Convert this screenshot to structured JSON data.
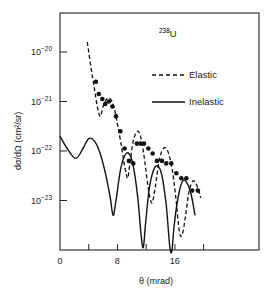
{
  "chart_data": {
    "type": "line",
    "title": "",
    "annotation": {
      "isotope_mass": "238",
      "isotope_symbol": "U"
    },
    "xlabel": "θ (mrad)",
    "ylabel": "dσ/dΩ  (cm²/sr)",
    "xlim": [
      0,
      28
    ],
    "ylim_log10": [
      -24.0,
      -19.2
    ],
    "yscale": "log",
    "grid": false,
    "legend_position": "upper right",
    "x_ticks": [
      0,
      4,
      8,
      12,
      16,
      20
    ],
    "x_tick_labels": [
      {
        "x": 0,
        "label": "0"
      },
      {
        "x": 8,
        "label": "8"
      },
      {
        "x": 16,
        "label": "16"
      }
    ],
    "y_ticks": [
      {
        "exp": -20,
        "label_base": "10",
        "label_exp": "−20"
      },
      {
        "exp": -21,
        "label_base": "10",
        "label_exp": "−21"
      },
      {
        "exp": -22,
        "label_base": "10",
        "label_exp": "−22"
      },
      {
        "exp": -23,
        "label_base": "10",
        "label_exp": "−23"
      }
    ],
    "series": [
      {
        "name": "Elastic",
        "style": "dashed",
        "points": [
          [
            3.8,
            -19.8
          ],
          [
            4.3,
            -20.3
          ],
          [
            4.8,
            -20.75
          ],
          [
            5.2,
            -21.1
          ],
          [
            5.6,
            -21.3
          ],
          [
            6.0,
            -21.1
          ],
          [
            6.5,
            -20.95
          ],
          [
            7.0,
            -20.95
          ],
          [
            7.5,
            -21.1
          ],
          [
            8.0,
            -21.45
          ],
          [
            8.5,
            -21.85
          ],
          [
            9.0,
            -22.3
          ],
          [
            9.4,
            -22.55
          ],
          [
            9.7,
            -22.3
          ],
          [
            10.2,
            -21.8
          ],
          [
            10.8,
            -21.6
          ],
          [
            11.3,
            -21.75
          ],
          [
            11.8,
            -22.2
          ],
          [
            12.3,
            -22.75
          ],
          [
            12.8,
            -23.05
          ],
          [
            13.3,
            -22.7
          ],
          [
            13.8,
            -22.2
          ],
          [
            14.4,
            -21.95
          ],
          [
            15.0,
            -22.0
          ],
          [
            15.6,
            -22.35
          ],
          [
            16.1,
            -22.9
          ],
          [
            16.6,
            -23.6
          ],
          [
            17.0,
            -23.7
          ],
          [
            17.5,
            -23.3
          ],
          [
            18.0,
            -22.8
          ],
          [
            18.6,
            -22.6
          ],
          [
            19.2,
            -22.75
          ],
          [
            19.6,
            -22.95
          ]
        ]
      },
      {
        "name": "Inelastic",
        "style": "solid",
        "points": [
          [
            0.0,
            -21.7
          ],
          [
            1.0,
            -21.95
          ],
          [
            2.2,
            -22.15
          ],
          [
            3.2,
            -21.95
          ],
          [
            4.0,
            -21.75
          ],
          [
            4.8,
            -21.8
          ],
          [
            5.6,
            -22.05
          ],
          [
            6.4,
            -22.5
          ],
          [
            7.0,
            -22.95
          ],
          [
            7.4,
            -23.3
          ],
          [
            7.8,
            -23.0
          ],
          [
            8.4,
            -22.4
          ],
          [
            9.0,
            -22.1
          ],
          [
            9.6,
            -22.05
          ],
          [
            10.2,
            -22.3
          ],
          [
            10.8,
            -22.9
          ],
          [
            11.3,
            -23.7
          ],
          [
            11.6,
            -23.95
          ],
          [
            11.9,
            -23.5
          ],
          [
            12.4,
            -22.8
          ],
          [
            13.0,
            -22.4
          ],
          [
            13.6,
            -22.3
          ],
          [
            14.2,
            -22.5
          ],
          [
            14.8,
            -23.1
          ],
          [
            15.3,
            -23.95
          ],
          [
            15.6,
            -24.0
          ],
          [
            15.9,
            -23.5
          ],
          [
            16.5,
            -22.9
          ],
          [
            17.1,
            -22.6
          ],
          [
            17.7,
            -22.65
          ],
          [
            18.3,
            -22.9
          ],
          [
            18.8,
            -23.3
          ]
        ]
      },
      {
        "name": "Data",
        "style": "markers",
        "points": [
          [
            5.0,
            -20.6
          ],
          [
            5.4,
            -20.85
          ],
          [
            5.9,
            -20.95
          ],
          [
            6.3,
            -21.05
          ],
          [
            6.8,
            -21.0
          ],
          [
            7.3,
            -21.1
          ],
          [
            7.8,
            -21.3
          ],
          [
            8.4,
            -21.6
          ],
          [
            9.0,
            -21.95
          ],
          [
            9.6,
            -22.2
          ],
          [
            10.2,
            -22.25
          ],
          [
            10.7,
            -21.85
          ],
          [
            11.2,
            -21.85
          ],
          [
            11.7,
            -21.85
          ],
          [
            12.3,
            -21.95
          ],
          [
            12.9,
            -22.05
          ],
          [
            13.5,
            -22.2
          ],
          [
            14.2,
            -22.2
          ],
          [
            14.8,
            -22.25
          ],
          [
            15.5,
            -22.25
          ],
          [
            16.2,
            -22.45
          ],
          [
            16.9,
            -22.55
          ],
          [
            17.6,
            -22.55
          ],
          [
            18.4,
            -22.8
          ],
          [
            19.2,
            -22.8
          ]
        ]
      }
    ],
    "legend": [
      {
        "label": "Elastic",
        "style": "dashed"
      },
      {
        "label": "Inelastic",
        "style": "solid"
      }
    ]
  }
}
